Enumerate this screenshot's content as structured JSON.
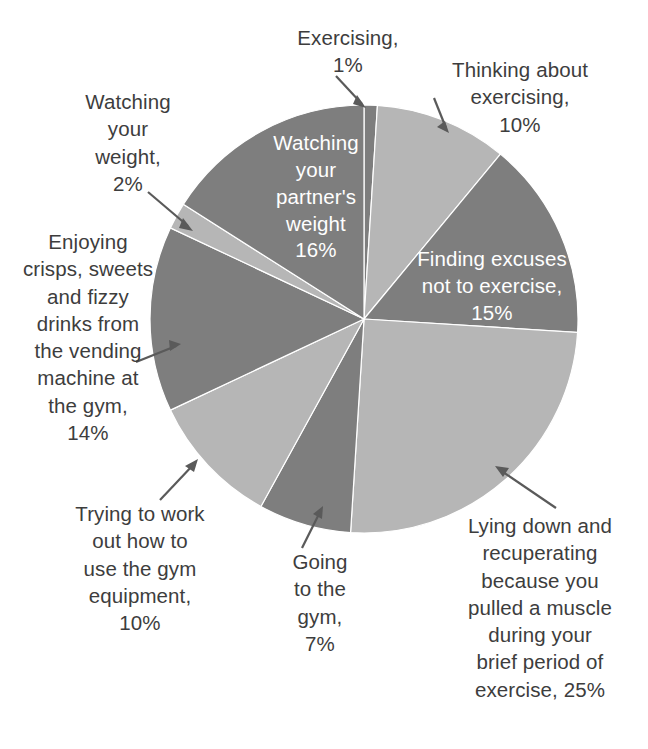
{
  "chart_data": {
    "type": "pie",
    "title": "",
    "total": 100,
    "unit": "%",
    "legend_position": "none",
    "center": {
      "x": 364,
      "y": 319
    },
    "radius": 214,
    "start_angle_deg": 0,
    "direction": "clockwise",
    "colors": {
      "light": "#b6b6b6",
      "dark": "#7e7e7e",
      "label_light": "#ffffff",
      "label_dark": "#3d3d3d",
      "background": "#ffffff",
      "leader_line": "#5a5a5a"
    },
    "categories": [
      "Exercising",
      "Thinking about exercising",
      "Finding excuses not to exercise",
      "Lying down and recuperating because you pulled a muscle during your brief period of exercise",
      "Going to the gym",
      "Trying to work out how to use the gym equipment",
      "Enjoying crisps, sweets and fizzy drinks from the vending machine at the gym",
      "Watching your weight",
      "Watching your partner's weight"
    ],
    "values": [
      1,
      10,
      15,
      25,
      7,
      10,
      14,
      2,
      16
    ],
    "slices": [
      {
        "label": "Exercising",
        "value": 1,
        "color": "#7e7e7e",
        "label_placement": "callout"
      },
      {
        "label": "Thinking about exercising",
        "value": 10,
        "color": "#b6b6b6",
        "label_placement": "callout"
      },
      {
        "label": "Finding excuses not to exercise",
        "value": 15,
        "color": "#7e7e7e",
        "label_placement": "inside"
      },
      {
        "label": "Lying down and recuperating because you pulled a muscle during your brief period of exercise",
        "value": 25,
        "color": "#b6b6b6",
        "label_placement": "callout"
      },
      {
        "label": "Going to the gym",
        "value": 7,
        "color": "#7e7e7e",
        "label_placement": "callout"
      },
      {
        "label": "Trying to work out how to use the gym equipment",
        "value": 10,
        "color": "#b6b6b6",
        "label_placement": "callout"
      },
      {
        "label": "Enjoying crisps, sweets and fizzy drinks from the vending machine at the gym",
        "value": 14,
        "color": "#7e7e7e",
        "label_placement": "callout"
      },
      {
        "label": "Watching your weight",
        "value": 2,
        "color": "#b6b6b6",
        "label_placement": "callout"
      },
      {
        "label": "Watching your partner's weight",
        "value": 16,
        "color": "#7e7e7e",
        "label_placement": "inside"
      }
    ]
  },
  "labels": {
    "exercising": "Exercising,\n1%",
    "thinking": "Thinking about\nexercising,\n10%",
    "watching_your_weight": "Watching\nyour\nweight,\n2%",
    "crisps": "Enjoying\ncrisps, sweets\nand fizzy\ndrinks from\nthe vending\nmachine at\nthe gym,\n14%",
    "trying": "Trying to work\nout how to\nuse the gym\nequipment,\n10%",
    "going": "Going\nto the\ngym,\n7%",
    "lying": "Lying down and\nrecuperating\nbecause you\npulled a muscle\nduring your\nbrief period of\nexercise, 25%",
    "partner": "Watching\nyour\npartner's\nweight\n16%",
    "excuses": "Finding excuses\nnot to exercise,\n15%"
  }
}
